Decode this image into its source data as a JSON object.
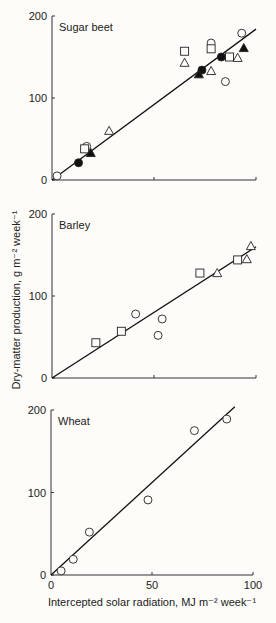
{
  "figure": {
    "ylabel": "Dry-matter production, g m⁻² week⁻¹",
    "xlabel": "Intercepted solar radiation, MJ m⁻² week⁻¹",
    "y_ticks": [
      "0",
      "100",
      "200"
    ],
    "x_ticks": [
      "0",
      "50",
      "100"
    ]
  },
  "chart_data": [
    {
      "type": "scatter",
      "title": "Sugar beet",
      "xlabel": "Intercepted solar radiation, MJ m-2 week-1",
      "ylabel": "Dry-matter production, g m-2 week-1",
      "xlim": [
        0,
        100
      ],
      "ylim": [
        0,
        200
      ],
      "fit_line": {
        "x": [
          0,
          100
        ],
        "y": [
          0,
          184
        ]
      },
      "series": [
        {
          "name": "open circle",
          "marker": "circle-open",
          "points": [
            [
              2.5,
              5
            ],
            [
              17,
              41
            ],
            [
              78,
              167
            ],
            [
              85,
              120
            ],
            [
              93,
              179
            ]
          ]
        },
        {
          "name": "filled circle",
          "marker": "circle-filled",
          "points": [
            [
              13,
              21
            ],
            [
              73.5,
              134
            ],
            [
              83,
              150
            ]
          ]
        },
        {
          "name": "open square",
          "marker": "square-open",
          "points": [
            [
              16,
              38
            ],
            [
              65,
              157
            ],
            [
              78,
              160
            ],
            [
              87,
              150
            ]
          ]
        },
        {
          "name": "open triangle",
          "marker": "triangle-open",
          "points": [
            [
              28,
              60
            ],
            [
              65,
              143
            ],
            [
              78,
              133
            ],
            [
              91,
              149
            ]
          ]
        },
        {
          "name": "filled triangle",
          "marker": "triangle-filled",
          "points": [
            [
              19,
              33
            ],
            [
              72,
              129
            ],
            [
              94,
              161
            ]
          ]
        }
      ]
    },
    {
      "type": "scatter",
      "title": "Barley",
      "xlim": [
        0,
        100
      ],
      "ylim": [
        0,
        200
      ],
      "fit_line": {
        "x": [
          0,
          100
        ],
        "y": [
          0,
          160
        ]
      },
      "series": [
        {
          "name": "open circle",
          "marker": "circle-open",
          "points": [
            [
              41,
              78
            ],
            [
              52,
              52
            ],
            [
              54,
              72
            ]
          ]
        },
        {
          "name": "open square",
          "marker": "square-open",
          "points": [
            [
              21.5,
              43
            ],
            [
              34,
              57
            ],
            [
              72.5,
              128
            ],
            [
              91,
              144
            ]
          ]
        },
        {
          "name": "open triangle",
          "marker": "triangle-open",
          "points": [
            [
              81,
              128
            ],
            [
              95.5,
              145
            ],
            [
              97.5,
              161
            ]
          ]
        }
      ]
    },
    {
      "type": "scatter",
      "title": "Wheat",
      "xlim": [
        0,
        100
      ],
      "ylim": [
        0,
        200
      ],
      "fit_line": {
        "x": [
          0,
          91
        ],
        "y": [
          0,
          204
        ]
      },
      "series": [
        {
          "name": "open circle",
          "marker": "circle-open",
          "points": [
            [
              5,
              5
            ],
            [
              11,
              19
            ],
            [
              19,
              52
            ],
            [
              48,
              91
            ],
            [
              71,
              175
            ],
            [
              87,
              189
            ]
          ]
        }
      ]
    }
  ]
}
